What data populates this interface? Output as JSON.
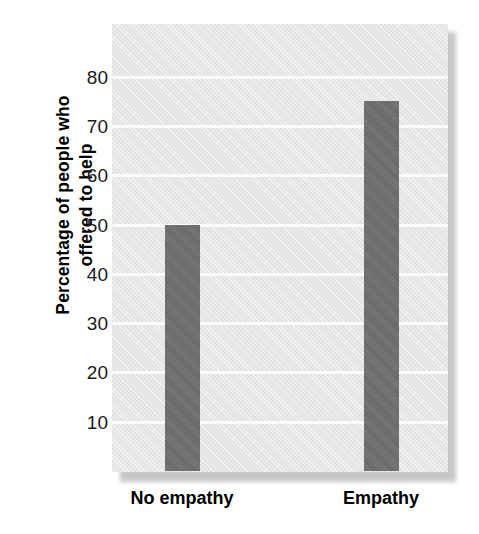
{
  "chart_data": {
    "type": "bar",
    "title": "",
    "subtitle": "",
    "categories": [
      "No empathy",
      "Empathy"
    ],
    "values": [
      50,
      75
    ],
    "series": [
      {
        "name": "Percentage of people who offered to help",
        "values": [
          50,
          75
        ]
      }
    ],
    "xlabel": "",
    "ylabel_line1": "Percentage of people who",
    "ylabel_line2": "offered to help",
    "ylabel": "Percentage of people who offered to help",
    "ylim": [
      0,
      88
    ],
    "yticks": [
      10,
      20,
      30,
      40,
      50,
      60,
      70,
      80
    ],
    "ytick_labels": [
      "10",
      "20",
      "30",
      "40",
      "50",
      "60",
      "70",
      "80"
    ],
    "grid": true,
    "grid_axis": "y",
    "grid_color": "#fbfbfb",
    "legend": false,
    "legend_position": "none",
    "bar_color": "#6e6e6e",
    "plot_background": "#e3e3e3",
    "figure_background": "#ffffff",
    "text_color": "#000000"
  }
}
